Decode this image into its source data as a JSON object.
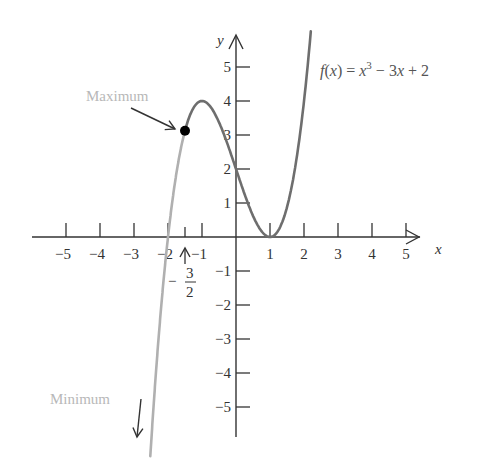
{
  "chart_data": {
    "type": "line",
    "title": "",
    "function_label": "f(x) = x^3 - 3x + 2",
    "function_label_parts": {
      "lhs": "f(x) = x",
      "exp": "3",
      "rhs": " − 3x + 2"
    },
    "xlabel": "x",
    "ylabel": "y",
    "xlim": [
      -6,
      6
    ],
    "ylim": [
      -6,
      6
    ],
    "grid": false,
    "legend": "none",
    "x_ticks": [
      -5,
      -4,
      -3,
      -2,
      -1,
      1,
      2,
      3,
      4,
      5
    ],
    "x_tick_labels": [
      "−5",
      "−4",
      "−3",
      "−2",
      "−1",
      "1",
      "2",
      "3",
      "4",
      "5"
    ],
    "y_ticks": [
      5,
      4,
      3,
      2,
      1,
      -1,
      -2,
      -3,
      -4,
      -5
    ],
    "y_tick_labels": [
      "5",
      "4",
      "3",
      "2",
      "1",
      "−1",
      "−2",
      "−3",
      "−4",
      "−5"
    ],
    "series": [
      {
        "name": "f(x) = x^3 - 3x + 2 (restricted, x ≤ -3/2)",
        "color": "#b0b0b0",
        "x": [
          -2.5,
          -2.25,
          -2.0,
          -1.75,
          -1.5
        ],
        "y": [
          -6.125,
          -2.641,
          0.0,
          1.891,
          3.125
        ]
      },
      {
        "name": "f(x) = x^3 - 3x + 2 (x ≥ -3/2)",
        "color": "#6e6e6e",
        "x": [
          -1.5,
          -1.0,
          -0.5,
          0.0,
          0.5,
          1.0,
          1.5,
          2.0,
          2.2
        ],
        "y": [
          3.125,
          4.0,
          3.375,
          2.0,
          0.625,
          0.0,
          0.875,
          4.0,
          6.048
        ]
      }
    ],
    "annotations": [
      {
        "text": "Maximum",
        "target": [
          -1.5,
          3.125
        ],
        "note": "endpoint marked with filled dot"
      },
      {
        "text": "Minimum",
        "target": [
          -2.5,
          -6.0
        ],
        "note": "arrow pointing downward along left branch"
      },
      {
        "text": "− 3/2",
        "target": [
          -1.5,
          0
        ],
        "note": "arrow pointing up at x-axis"
      }
    ],
    "marked_point": {
      "x": -1.5,
      "y": 3.125
    }
  },
  "labels": {
    "maximum": "Maximum",
    "minimum": "Minimum",
    "neg_sign": "−",
    "frac_num": "3",
    "frac_den": "2",
    "x_axis": "x",
    "y_axis": "y"
  }
}
